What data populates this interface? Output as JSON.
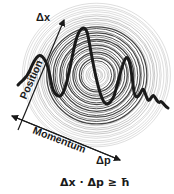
{
  "diagram": {
    "labels": {
      "delta_x": "Δx",
      "position": "Position",
      "momentum": "Momentum",
      "delta_p": "Δp",
      "formula": "Δx · Δp ≥ ħ"
    },
    "colors": {
      "ink": "#1a1a1a",
      "rings": "#555555",
      "background": "#ffffff"
    },
    "rings": {
      "center": [
        96,
        75
      ],
      "count": 34,
      "max_radius": 74
    }
  }
}
